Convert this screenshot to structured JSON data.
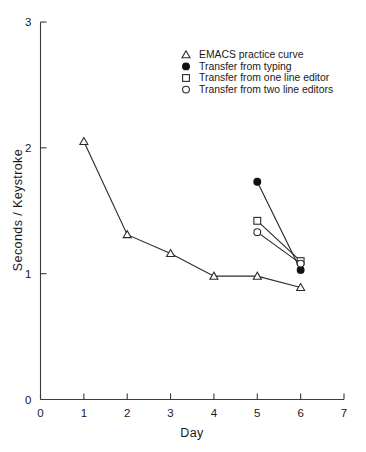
{
  "chart_data": {
    "type": "line",
    "title": "",
    "xlabel": "Day",
    "ylabel": "Seconds / Keystroke",
    "xlim": [
      0,
      7
    ],
    "ylim": [
      0,
      3
    ],
    "xticks": [
      "0",
      "1",
      "2",
      "3",
      "4",
      "5",
      "6",
      "7"
    ],
    "yticks": [
      "0",
      "1",
      "2",
      "3"
    ],
    "grid": false,
    "legend_position": "upper-center",
    "series": [
      {
        "name": "EMACS  practice curve",
        "marker": "open-triangle",
        "x": [
          1,
          2,
          3,
          4,
          5,
          6
        ],
        "values": [
          2.05,
          1.31,
          1.16,
          0.98,
          0.98,
          0.89
        ]
      },
      {
        "name": "Transfer from typing",
        "marker": "filled-circle",
        "x": [
          5,
          6
        ],
        "values": [
          1.73,
          1.03
        ]
      },
      {
        "name": "Transfer from one line editor",
        "marker": "open-square",
        "x": [
          5,
          6
        ],
        "values": [
          1.42,
          1.1
        ]
      },
      {
        "name": "Transfer from two line editors",
        "marker": "open-circle",
        "x": [
          5,
          6
        ],
        "values": [
          1.33,
          1.08
        ]
      }
    ]
  },
  "legend": {
    "items": [
      {
        "label": "EMACS  practice curve",
        "marker": "open-triangle"
      },
      {
        "label": "Transfer from typing",
        "marker": "filled-circle"
      },
      {
        "label": "Transfer from one line editor",
        "marker": "open-square"
      },
      {
        "label": "Transfer from two line editors",
        "marker": "open-circle"
      }
    ]
  },
  "colors": {
    "ink": "#1a1a1a",
    "line": "#2b2b2b",
    "marker_fill": "#101010",
    "background": "#ffffff"
  }
}
